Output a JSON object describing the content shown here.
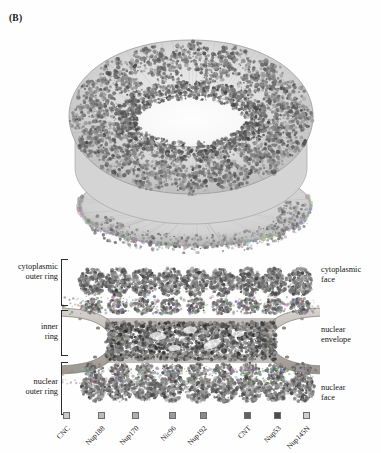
{
  "figure": {
    "panel_label": "(B)",
    "background_color": "#fefefe",
    "ink_color": "#141414"
  },
  "top_render": {
    "name": "nuclear-pore-complex-3d-render",
    "description": "three-dimensional cut-away surface render of the nuclear pore complex scaffold viewed obliquely from the cytoplasmic face, showing a central ring aperture"
  },
  "cross_section": {
    "name": "nuclear-pore-complex-cross-section",
    "description": "side cut-away cross-section of the nuclear pore complex showing cytoplasmic outer ring, inner ring and nuclear outer ring spanning the nuclear envelope"
  },
  "annotations": {
    "left": [
      {
        "id": "cytoplasmic-outer-ring",
        "line1": "cytoplasmic",
        "line2": "outer ring"
      },
      {
        "id": "inner-ring",
        "line1": "inner",
        "line2": "ring"
      },
      {
        "id": "nuclear-outer-ring",
        "line1": "nuclear",
        "line2": "outer ring"
      }
    ],
    "right": [
      {
        "id": "cytoplasmic-face",
        "line1": "cytoplasmic",
        "line2": "face"
      },
      {
        "id": "nuclear-envelope",
        "line1": "nuclear",
        "line2": "envelope"
      },
      {
        "id": "nuclear-face",
        "line1": "nuclear",
        "line2": "face"
      }
    ]
  },
  "legend": {
    "entries": [
      {
        "label": "CNC",
        "color": "#c9c9c9",
        "x": 66
      },
      {
        "label": "Nup188",
        "color": "#bcbcbc",
        "x": 101
      },
      {
        "label": "Nup170",
        "color": "#b0b0b0",
        "x": 135
      },
      {
        "label": "Nic96",
        "color": "#9a9a9a",
        "x": 172
      },
      {
        "label": "Nup192",
        "color": "#8a8a8a",
        "x": 203
      },
      {
        "label": "CNT",
        "color": "#616161",
        "x": 247
      },
      {
        "label": "Nup53",
        "color": "#4c4c4c",
        "x": 277
      },
      {
        "label": "Nup145N",
        "color": "#cfcfcf",
        "x": 306
      }
    ]
  }
}
